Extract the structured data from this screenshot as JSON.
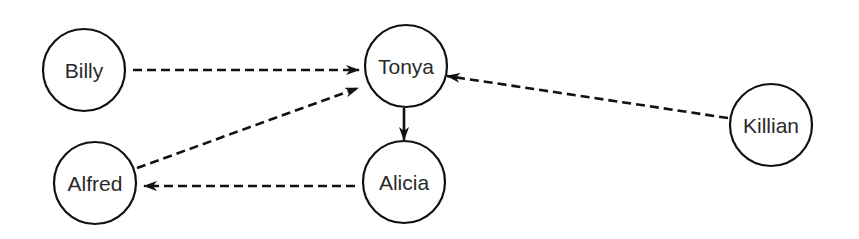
{
  "diagram": {
    "type": "directed-graph",
    "colors": {
      "stroke": "#111111",
      "text": "#2a2a2a",
      "background": "#ffffff"
    },
    "nodes": [
      {
        "id": "billy",
        "label": "Billy",
        "cx": 84,
        "cy": 70,
        "r": 41
      },
      {
        "id": "tonya",
        "label": "Tonya",
        "cx": 406,
        "cy": 66,
        "r": 41
      },
      {
        "id": "alfred",
        "label": "Alfred",
        "cx": 95,
        "cy": 183,
        "r": 41
      },
      {
        "id": "alicia",
        "label": "Alicia",
        "cx": 404,
        "cy": 182,
        "r": 41
      },
      {
        "id": "killian",
        "label": "Killian",
        "cx": 771,
        "cy": 125,
        "r": 41
      }
    ],
    "edges": [
      {
        "from": "billy",
        "to": "tonya",
        "style": "dashed",
        "x1": 133,
        "y1": 70,
        "x2": 359,
        "y2": 70
      },
      {
        "from": "alfred",
        "to": "tonya",
        "style": "dashed",
        "x1": 137,
        "y1": 168,
        "x2": 358,
        "y2": 88
      },
      {
        "from": "killian",
        "to": "tonya",
        "style": "dashed",
        "x1": 728,
        "y1": 118,
        "x2": 447,
        "y2": 76
      },
      {
        "from": "tonya",
        "to": "alicia",
        "style": "solid",
        "x1": 404,
        "y1": 108,
        "x2": 404,
        "y2": 140
      },
      {
        "from": "alicia",
        "to": "alfred",
        "style": "dashed",
        "x1": 355,
        "y1": 186,
        "x2": 144,
        "y2": 186
      }
    ]
  }
}
